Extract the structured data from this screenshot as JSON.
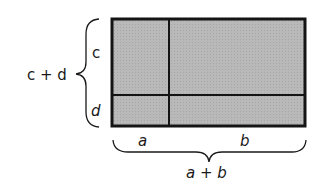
{
  "diagram": {
    "fill_color": "#b8b8b8",
    "stroke_color": "#141414",
    "background": "#ffffff",
    "labels": {
      "left_total": "c + d",
      "left_top": "c",
      "left_bottom": "d",
      "bottom_left": "a",
      "bottom_right": "b",
      "bottom_total": "a + b"
    },
    "rectangle": {
      "x": 112,
      "y": 19,
      "width": 193,
      "height": 107
    },
    "dividers": {
      "vertical_x": 169,
      "horizontal_y": 95
    },
    "regions": [
      "ac",
      "bc",
      "ad",
      "bd"
    ]
  }
}
